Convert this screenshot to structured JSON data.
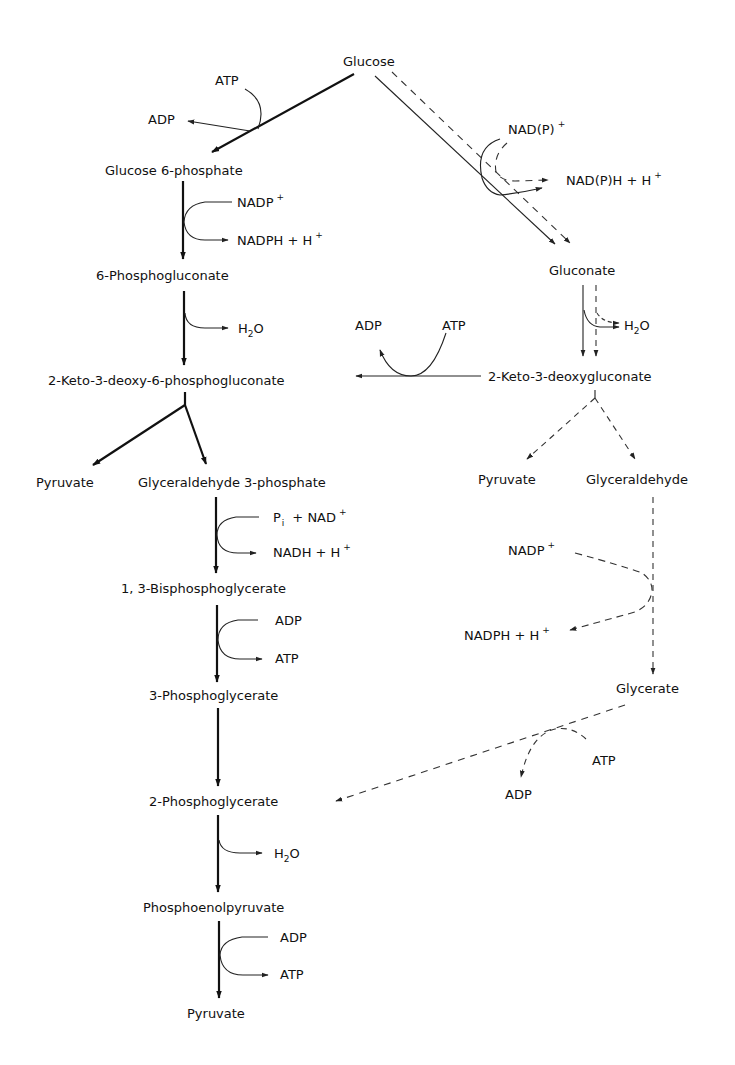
{
  "diagram": {
    "type": "metabolic-pathway",
    "left_pathway": {
      "metabolites": [
        {
          "id": "glucose",
          "label": "Glucose"
        },
        {
          "id": "g6p",
          "label": "Glucose 6-phosphate"
        },
        {
          "id": "6pg",
          "label": "6-Phosphogluconate"
        },
        {
          "id": "kdpg",
          "label": "2-Keto-3-deoxy-6-phosphogluconate"
        },
        {
          "id": "pyruvate1",
          "label": "Pyruvate"
        },
        {
          "id": "g3p",
          "label": "Glyceraldehyde 3-phosphate"
        },
        {
          "id": "13bpg",
          "label": "1, 3-Bisphosphoglycerate"
        },
        {
          "id": "3pg",
          "label": "3-Phosphoglycerate"
        },
        {
          "id": "2pg",
          "label": "2-Phosphoglycerate"
        },
        {
          "id": "pep",
          "label": "Phosphoenolpyruvate"
        },
        {
          "id": "pyruvate2",
          "label": "Pyruvate"
        }
      ],
      "cofactors": {
        "hexokinase_in": "ATP",
        "hexokinase_out": "ADP",
        "g6pdh_in": "NADP",
        "g6pdh_in_sup": "+",
        "g6pdh_out": "NADPH + H",
        "g6pdh_out_sup": "+",
        "dehydratase_out_main": "H",
        "dehydratase_out_sub": "2",
        "dehydratase_out_end": "O",
        "gapdh_in_p": "P",
        "gapdh_in_sub": "i",
        "gapdh_in_rest": "+ NAD",
        "gapdh_in_sup": "+",
        "gapdh_out": "NADH + H",
        "gapdh_out_sup": "+",
        "pgk_in": "ADP",
        "pgk_out": "ATP",
        "enolase_out_main": "H",
        "enolase_out_sub": "2",
        "enolase_out_end": "O",
        "pk_in": "ADP",
        "pk_out": "ATP"
      }
    },
    "right_pathway": {
      "metabolites": [
        {
          "id": "gluconate",
          "label": "Gluconate"
        },
        {
          "id": "kdg",
          "label": "2-Keto-3-deoxygluconate"
        },
        {
          "id": "pyruvate3",
          "label": "Pyruvate"
        },
        {
          "id": "glyceraldehyde",
          "label": "Glyceraldehyde"
        },
        {
          "id": "glycerate",
          "label": "Glycerate"
        }
      ],
      "cofactors": {
        "gdh_in": "NAD(P)",
        "gdh_in_sup": "+",
        "gdh_out": "NAD(P)H + H",
        "gdh_out_sup": "+",
        "dehydratase_out_main": "H",
        "dehydratase_out_sub": "2",
        "dehydratase_out_end": "O",
        "kdg_kinase_in": "ATP",
        "kdg_kinase_out": "ADP",
        "gald_dh_in": "NADP",
        "gald_dh_in_sup": "+",
        "gald_dh_out": "NADPH + H",
        "gald_dh_out_sup": "+",
        "glycerate_kinase_in": "ATP",
        "glycerate_kinase_out": "ADP"
      }
    },
    "line_styles": {
      "thick_solid": "main Entner-Doudoroff / lower glycolysis path",
      "thin_solid": "semi-phosphorylative branch",
      "dashed": "non-phosphorylative branch"
    }
  }
}
